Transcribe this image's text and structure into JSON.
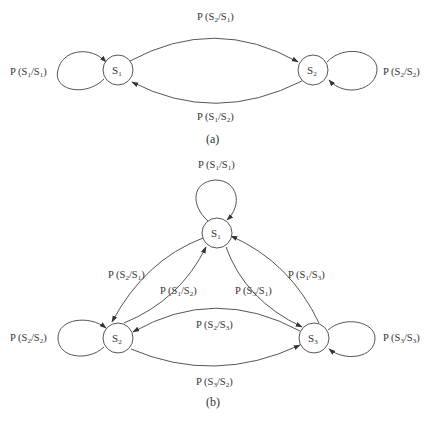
{
  "diagram_a": {
    "caption": "(a)",
    "nodes": [
      {
        "id": "S1",
        "label_main": "S",
        "label_sub": "1"
      },
      {
        "id": "S2",
        "label_main": "S",
        "label_sub": "2"
      }
    ],
    "edges": {
      "s1_s1": {
        "p": "P (S",
        "a": "1",
        "mid": "/S",
        "b": "1",
        "end": ")"
      },
      "s2_s1": {
        "p": "P (S",
        "a": "2",
        "mid": "/S",
        "b": "1",
        "end": ")"
      },
      "s1_s2": {
        "p": "P (S",
        "a": "1",
        "mid": "/S",
        "b": "2",
        "end": ")"
      },
      "s2_s2": {
        "p": "P (S",
        "a": "2",
        "mid": "/S",
        "b": "2",
        "end": ")"
      }
    }
  },
  "diagram_b": {
    "caption": "(b)",
    "nodes": [
      {
        "id": "S1",
        "label_main": "S",
        "label_sub": "1"
      },
      {
        "id": "S2",
        "label_main": "S",
        "label_sub": "2"
      },
      {
        "id": "S3",
        "label_main": "S",
        "label_sub": "3"
      }
    ],
    "edges": {
      "s1_s1": {
        "p": "P (S",
        "a": "1",
        "mid": "/S",
        "b": "1",
        "end": ")"
      },
      "s2_s1": {
        "p": "P (S",
        "a": "2",
        "mid": "/S",
        "b": "1",
        "end": ")"
      },
      "s1_s2": {
        "p": "P (S",
        "a": "1",
        "mid": "/S",
        "b": "2",
        "end": ")"
      },
      "s3_s1": {
        "p": "P (S",
        "a": "3",
        "mid": "/S",
        "b": "1",
        "end": ")"
      },
      "s1_s3": {
        "p": "P (S",
        "a": "1",
        "mid": "/S",
        "b": "3",
        "end": ")"
      },
      "s2_s3": {
        "p": "P (S",
        "a": "2",
        "mid": "/S",
        "b": "3",
        "end": ")"
      },
      "s3_s2": {
        "p": "P (S",
        "a": "3",
        "mid": "/S",
        "b": "2",
        "end": ")"
      },
      "s2_s2": {
        "p": "P (S",
        "a": "2",
        "mid": "/S",
        "b": "2",
        "end": ")"
      },
      "s3_s3": {
        "p": "P (S",
        "a": "3",
        "mid": "/S",
        "b": "3",
        "end": ")"
      }
    }
  },
  "colors": {
    "line": "#555555",
    "text": "#333333",
    "background": "#ffffff"
  }
}
